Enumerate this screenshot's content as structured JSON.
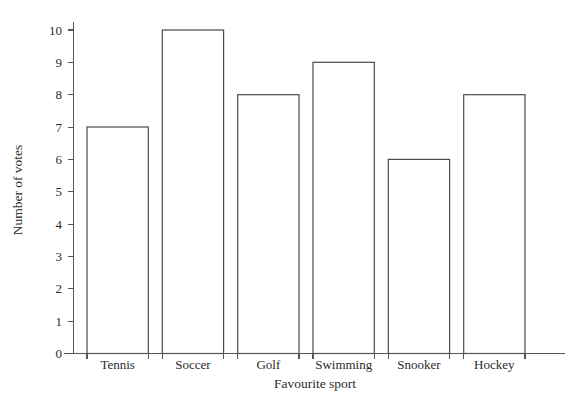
{
  "chart_data": {
    "type": "bar",
    "title": "",
    "subtitle": "",
    "xlabel": "Favourite sport",
    "ylabel": "Number of votes",
    "categories": [
      "Tennis",
      "Soccer",
      "Golf",
      "Swimming",
      "Snooker",
      "Hockey"
    ],
    "values": [
      7,
      10,
      8,
      9,
      6,
      8
    ],
    "ylim": [
      0,
      10
    ],
    "yticks": [
      "0",
      "1",
      "2",
      "3",
      "4",
      "5",
      "6",
      "7",
      "8",
      "9",
      "10"
    ],
    "ytick_values": [
      0,
      1,
      2,
      3,
      4,
      5,
      6,
      7,
      8,
      9,
      10
    ],
    "grid": false,
    "legend": "none",
    "bar_fill_color": "#ffffff",
    "bar_edge_color": "#4a4a4a",
    "axis_color": "#555555",
    "text_color": "#2b2b2b",
    "background_color": "#ffffff"
  }
}
